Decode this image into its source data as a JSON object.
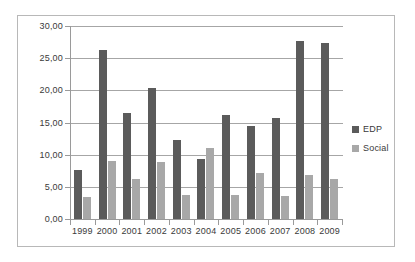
{
  "chart_data": {
    "type": "bar",
    "title": "",
    "subtitle": "",
    "xlabel": "",
    "ylabel": "",
    "categories": [
      "1999",
      "2000",
      "2001",
      "2002",
      "2003",
      "2004",
      "2005",
      "2006",
      "2007",
      "2008",
      "2009"
    ],
    "series": [
      {
        "name": "EDP",
        "color": "#5b5b5b",
        "values": [
          7.6,
          26.2,
          16.5,
          20.4,
          12.3,
          9.4,
          16.2,
          14.5,
          15.7,
          27.7,
          27.4
        ]
      },
      {
        "name": "Social",
        "color": "#a8a8a8",
        "values": [
          3.4,
          9.0,
          6.2,
          8.8,
          3.8,
          11.1,
          3.8,
          7.1,
          3.6,
          6.9,
          6.2
        ]
      }
    ],
    "ylim": [
      0,
      30
    ],
    "yticks": [
      0,
      5,
      10,
      15,
      20,
      25,
      30
    ],
    "ytick_labels": [
      "0,00",
      "5,00",
      "10,00",
      "15,00",
      "20,00",
      "25,00",
      "30,00"
    ],
    "grid": true,
    "grid_axis": "y",
    "legend_position": "right",
    "decimal_separator": ","
  },
  "legend": {
    "items": [
      {
        "label": "EDP",
        "color": "#5b5b5b"
      },
      {
        "label": "Social",
        "color": "#a8a8a8"
      }
    ]
  },
  "colors": {
    "edp": "#5b5b5b",
    "social": "#a8a8a8",
    "grid": "#a6a6a6",
    "axis": "#9a9a9a",
    "border": "#b8b8b8",
    "text": "#3a3a3a",
    "background": "#ffffff"
  }
}
